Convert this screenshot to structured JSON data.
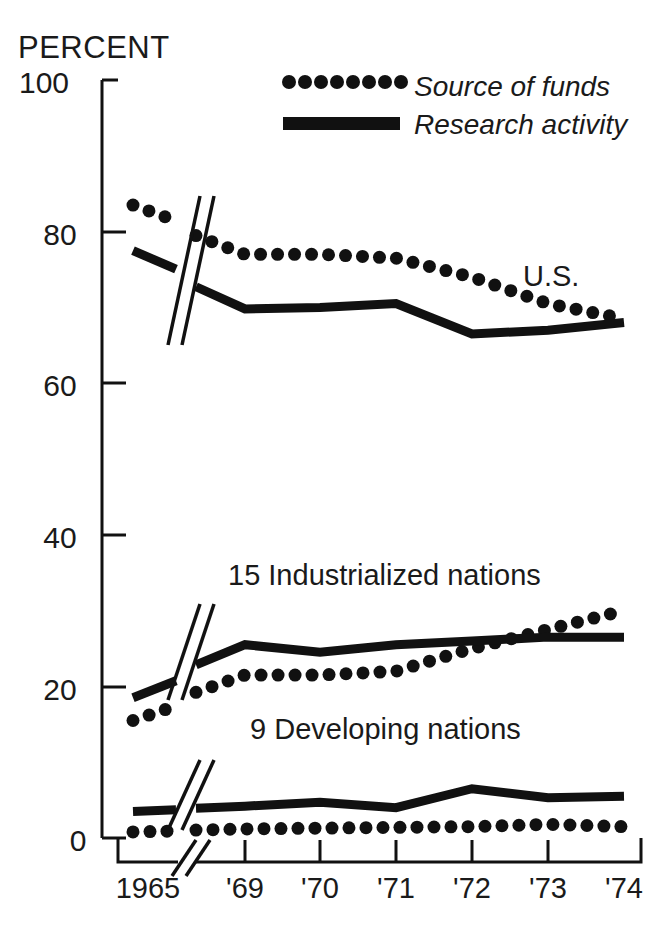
{
  "chart_data": {
    "type": "line",
    "title": "",
    "ylabel": "PERCENT",
    "xlabel": "",
    "ylim": [
      0,
      100
    ],
    "yticks": [
      0,
      20,
      40,
      60,
      80,
      100
    ],
    "grid": false,
    "axis_break": true,
    "axis_break_note": "x-axis broken between 1965 and '69",
    "categories": [
      "1965",
      "'69",
      "'70",
      "'71",
      "'72",
      "'73",
      "'74"
    ],
    "legend": {
      "position": "top-right",
      "entries": [
        {
          "name": "Source of funds",
          "style": "dotted"
        },
        {
          "name": "Research activity",
          "style": "solid"
        }
      ]
    },
    "groups": [
      {
        "label": "U.S.",
        "label_position": "upper-right",
        "series": [
          {
            "name": "Source of funds",
            "style": "dotted",
            "values": [
              83.5,
              77.0,
              77.0,
              76.5,
              74.0,
              70.5,
              68.5
            ]
          },
          {
            "name": "Research activity",
            "style": "solid",
            "values": [
              77.5,
              69.8,
              70.0,
              70.5,
              66.5,
              67.0,
              68.0
            ]
          }
        ]
      },
      {
        "label": "15 Industrialized nations",
        "label_position": "middle",
        "series": [
          {
            "name": "Source of funds",
            "style": "dotted",
            "values": [
              15.5,
              21.5,
              21.5,
              22.0,
              25.0,
              27.5,
              30.0
            ]
          },
          {
            "name": "Research activity",
            "style": "solid",
            "values": [
              18.5,
              25.5,
              24.5,
              25.5,
              26.0,
              26.5,
              26.5
            ]
          }
        ]
      },
      {
        "label": "9 Developing nations",
        "label_position": "lower",
        "series": [
          {
            "name": "Source of funds",
            "style": "dotted",
            "values": [
              0.8,
              1.2,
              1.3,
              1.4,
              1.5,
              1.8,
              1.5
            ]
          },
          {
            "name": "Research activity",
            "style": "solid",
            "values": [
              3.5,
              4.2,
              4.7,
              4.0,
              6.5,
              5.3,
              5.5
            ]
          }
        ]
      }
    ]
  },
  "labels": {
    "percent": "PERCENT",
    "y_100": "100",
    "y_80": "80",
    "y_60": "60",
    "y_40": "40",
    "y_20": "20",
    "y_0": "0",
    "x_1965": "1965",
    "x_69": "'69",
    "x_70": "'70",
    "x_71": "'71",
    "x_72": "'72",
    "x_73": "'73",
    "x_74": "'74",
    "legend_source": "Source of funds",
    "legend_research": "Research activity",
    "group_us": "U.S.",
    "group_industrialized": "15 Industrialized nations",
    "group_developing": "9 Developing nations"
  },
  "colors": {
    "ink": "#111111",
    "paper": "#ffffff"
  }
}
